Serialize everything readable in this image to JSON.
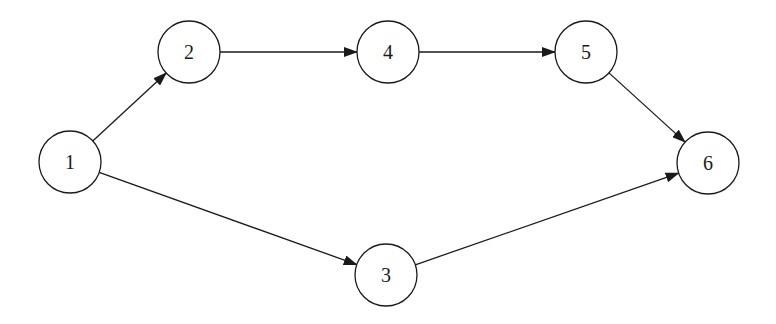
{
  "diagram": {
    "type": "directed-graph",
    "colors": {
      "stroke": "#1a1a1a",
      "fill": "#ffffff",
      "background": "#ffffff"
    },
    "node_radius": 31,
    "nodes": [
      {
        "id": "1",
        "label": "1",
        "x": 70,
        "y": 162
      },
      {
        "id": "2",
        "label": "2",
        "x": 189,
        "y": 52
      },
      {
        "id": "3",
        "label": "3",
        "x": 386,
        "y": 275
      },
      {
        "id": "4",
        "label": "4",
        "x": 388,
        "y": 52
      },
      {
        "id": "5",
        "label": "5",
        "x": 586,
        "y": 52
      },
      {
        "id": "6",
        "label": "6",
        "x": 708,
        "y": 163
      }
    ],
    "edges": [
      {
        "from": "1",
        "to": "2"
      },
      {
        "from": "1",
        "to": "3"
      },
      {
        "from": "2",
        "to": "4"
      },
      {
        "from": "4",
        "to": "5"
      },
      {
        "from": "5",
        "to": "6"
      },
      {
        "from": "3",
        "to": "6"
      }
    ]
  }
}
